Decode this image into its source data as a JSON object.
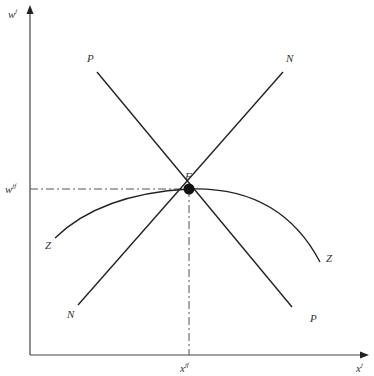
{
  "diagram": {
    "axes": {
      "y_label": "w",
      "y_label_sup": "j",
      "x_label": "x",
      "x_label_sup": "j"
    },
    "equilibrium": {
      "point_label": "F",
      "w_label": "w",
      "w_label_sup": "jf",
      "x_label": "x",
      "x_label_sup": "jf"
    },
    "curves": {
      "P": {
        "label_start": "P",
        "label_end": "P"
      },
      "N": {
        "label_start": "N",
        "label_end": "N"
      },
      "Z": {
        "label_start": "Z",
        "label_end": "Z"
      }
    },
    "colors": {
      "line": "#222222",
      "axis": "#444444",
      "dashed": "#555555"
    }
  }
}
